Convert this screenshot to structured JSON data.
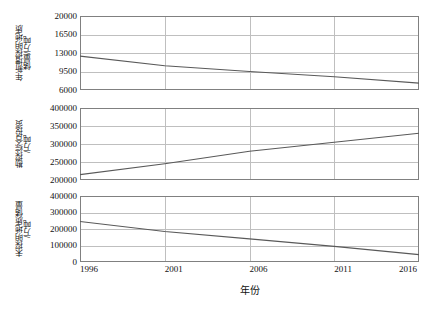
{
  "chart_data": [
    {
      "type": "line",
      "title": "",
      "ylabel": "年新增探明地质\n储量/万吨",
      "xlabel": "",
      "x": [
        1996,
        2001,
        2006,
        2011,
        2016
      ],
      "values": [
        12400,
        10600,
        9500,
        8500,
        7300
      ],
      "series": [
        {
          "name": "年新增探明地质储量",
          "values": [
            12400,
            10600,
            9500,
            8500,
            7300
          ]
        }
      ],
      "yticks": [
        6000,
        9500,
        13000,
        16500,
        20000
      ],
      "ylim": [
        6000,
        20000
      ],
      "xticks": [
        1996,
        2001,
        2006,
        2011,
        2016
      ],
      "xticklabels": [
        "1996",
        "2001",
        "2006",
        "2011",
        "2016"
      ],
      "xlim": [
        1996,
        2016
      ],
      "grid": true,
      "legend": "none",
      "line_color": "#595959"
    },
    {
      "type": "line",
      "title": "",
      "ylabel": "勘探综合投资\n/万吨",
      "xlabel": "",
      "x": [
        1996,
        2001,
        2006,
        2011,
        2016
      ],
      "values": [
        215000,
        245000,
        280000,
        305000,
        330000
      ],
      "series": [
        {
          "name": "勘探综合投资",
          "values": [
            215000,
            245000,
            280000,
            305000,
            330000
          ]
        }
      ],
      "yticks": [
        200000,
        250000,
        300000,
        350000,
        400000
      ],
      "ylim": [
        200000,
        400000
      ],
      "xticks": [
        1996,
        2001,
        2006,
        2011,
        2016
      ],
      "xticklabels": [
        "1996",
        "2001",
        "2006",
        "2011",
        "2016"
      ],
      "xlim": [
        1996,
        2016
      ],
      "grid": true,
      "legend": "none",
      "line_color": "#595959"
    },
    {
      "type": "line",
      "title": "",
      "ylabel": "未探明地质储量\n/万吨",
      "xlabel": "年份",
      "x": [
        1996,
        2001,
        2006,
        2011,
        2016
      ],
      "values": [
        245000,
        185000,
        140000,
        95000,
        45000
      ],
      "series": [
        {
          "name": "未探明地质储量",
          "values": [
            245000,
            185000,
            140000,
            95000,
            45000
          ]
        }
      ],
      "yticks": [
        0,
        100000,
        200000,
        300000,
        400000
      ],
      "ylim": [
        0,
        400000
      ],
      "xticks": [
        1996,
        2001,
        2006,
        2011,
        2016
      ],
      "xticklabels": [
        "1996",
        "2001",
        "2006",
        "2011",
        "2016"
      ],
      "xlim": [
        1996,
        2016
      ],
      "grid": true,
      "legend": "none",
      "line_color": "#595959"
    }
  ],
  "axis": {
    "x_title": "年份",
    "panel1_y_title": "年新增探明地质\n储量/万吨",
    "panel2_y_title": "勘探综合投资\n/万吨",
    "panel3_y_title": "未探明地质储量\n/万吨"
  },
  "style": {
    "frame_color": "#808080",
    "grid_color": "#bfbfbf",
    "line_color": "#595959",
    "text_color": "#111111",
    "background": "#ffffff"
  }
}
